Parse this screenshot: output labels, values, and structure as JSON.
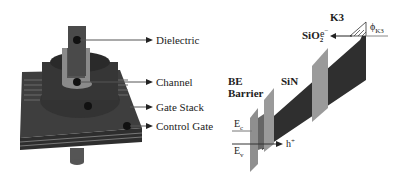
{
  "left_figure": {
    "labels": [
      {
        "id": "dielectric",
        "text": "Dielectric"
      },
      {
        "id": "channel",
        "text": "Channel"
      },
      {
        "id": "gate_stack",
        "text": "Gate Stack"
      },
      {
        "id": "control_gate",
        "text": "Control Gate"
      }
    ]
  },
  "right_figure": {
    "layers": {
      "be_barrier_line1": "BE",
      "be_barrier_line2": "Barrier",
      "sin": "SiN",
      "sio2": "SiO",
      "sio2_sub": "2",
      "k3": "K3"
    },
    "bands": {
      "ec": "E",
      "ec_sub": "c",
      "ev": "E",
      "ev_sub": "v"
    },
    "carriers": {
      "electron": "e",
      "electron_sup": "−",
      "hole": "h",
      "hole_sup": "+"
    },
    "work_function": {
      "symbol": "ϕ",
      "sub": "K3"
    }
  },
  "colors": {
    "device_dark": "#3a3a3a",
    "device_mid": "#555555",
    "channel_light": "#8a8a8a",
    "band_dark": "#2f2f2f",
    "barrier_gray": "#9a9a9a"
  }
}
